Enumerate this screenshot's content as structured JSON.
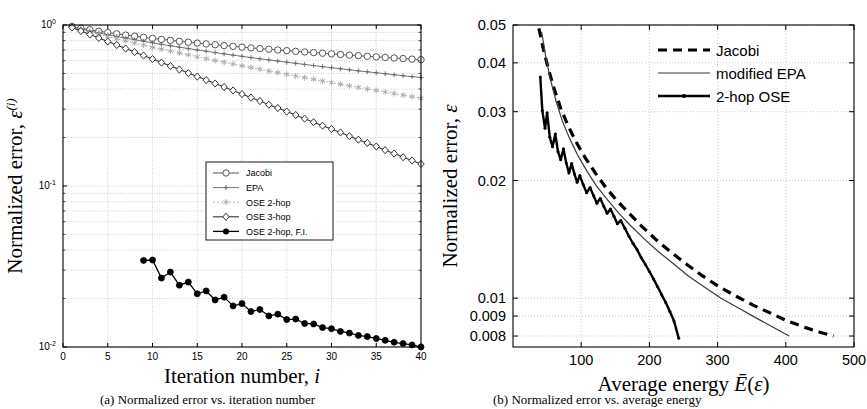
{
  "figure": {
    "panel_a_caption": "(a) Normalized error vs. iteration number",
    "panel_b_caption": "(b) Normalized error vs. average energy"
  },
  "chart_data": [
    {
      "id": "panel-a",
      "type": "line",
      "title": "",
      "xlabel": "Iteration number, i",
      "ylabel": "Normalized error, ε(i)",
      "ylabel_main": "Normalized error, ",
      "ylabel_sym": "ε",
      "ylabel_sup": "(i)",
      "yscale": "log",
      "xlim": [
        0,
        40
      ],
      "ylim": [
        0.01,
        1
      ],
      "grid": true,
      "xticks": [
        0,
        5,
        10,
        15,
        20,
        25,
        30,
        35,
        40
      ],
      "xticklabels": [
        "0",
        "5",
        "10",
        "15",
        "20",
        "25",
        "30",
        "35",
        "40"
      ],
      "yticks": [
        1,
        0.1,
        0.01
      ],
      "yticklabels": [
        "10^0",
        "10^-1",
        "10^-2"
      ],
      "legend_position": "center",
      "series": [
        {
          "name": "Jacobi",
          "marker": "circle-open",
          "color": "#555555",
          "linewidth": 1,
          "dash": "none",
          "x": [
            1,
            2,
            3,
            4,
            5,
            6,
            7,
            8,
            9,
            10,
            11,
            12,
            13,
            14,
            15,
            16,
            17,
            18,
            19,
            20,
            21,
            22,
            23,
            24,
            25,
            26,
            27,
            28,
            29,
            30,
            31,
            32,
            33,
            34,
            35,
            36,
            37,
            38,
            39,
            40
          ],
          "y": [
            0.98,
            0.955,
            0.935,
            0.915,
            0.897,
            0.881,
            0.866,
            0.852,
            0.838,
            0.826,
            0.814,
            0.803,
            0.792,
            0.782,
            0.772,
            0.763,
            0.754,
            0.745,
            0.737,
            0.729,
            0.721,
            0.714,
            0.707,
            0.7,
            0.693,
            0.686,
            0.68,
            0.674,
            0.668,
            0.662,
            0.656,
            0.65,
            0.645,
            0.639,
            0.634,
            0.629,
            0.624,
            0.619,
            0.614,
            0.609
          ]
        },
        {
          "name": "EPA",
          "marker": "plus",
          "color": "#666666",
          "linewidth": 0.9,
          "dash": "none",
          "x": [
            1,
            2,
            3,
            4,
            5,
            6,
            7,
            8,
            9,
            10,
            11,
            12,
            13,
            14,
            15,
            16,
            17,
            18,
            19,
            20,
            21,
            22,
            23,
            24,
            25,
            26,
            27,
            28,
            29,
            30,
            31,
            32,
            33,
            34,
            35,
            36,
            37,
            38,
            39,
            40
          ],
          "y": [
            0.975,
            0.945,
            0.918,
            0.893,
            0.87,
            0.849,
            0.829,
            0.81,
            0.792,
            0.775,
            0.759,
            0.743,
            0.728,
            0.714,
            0.7,
            0.687,
            0.674,
            0.662,
            0.65,
            0.639,
            0.628,
            0.617,
            0.607,
            0.597,
            0.587,
            0.578,
            0.569,
            0.56,
            0.551,
            0.543,
            0.535,
            0.527,
            0.519,
            0.512,
            0.505,
            0.498,
            0.491,
            0.484,
            0.478,
            0.472
          ]
        },
        {
          "name": "OSE 2-hop",
          "marker": "star",
          "color": "#aaaaaa",
          "linewidth": 0.9,
          "dash": "2,2",
          "x": [
            1,
            2,
            3,
            4,
            5,
            6,
            7,
            8,
            9,
            10,
            11,
            12,
            13,
            14,
            15,
            16,
            17,
            18,
            19,
            20,
            21,
            22,
            23,
            24,
            25,
            26,
            27,
            28,
            29,
            30,
            31,
            32,
            33,
            34,
            35,
            36,
            37,
            38,
            39,
            40
          ],
          "y": [
            0.972,
            0.938,
            0.906,
            0.876,
            0.848,
            0.822,
            0.797,
            0.773,
            0.751,
            0.729,
            0.709,
            0.689,
            0.67,
            0.652,
            0.635,
            0.618,
            0.602,
            0.587,
            0.572,
            0.558,
            0.544,
            0.531,
            0.518,
            0.506,
            0.494,
            0.482,
            0.471,
            0.46,
            0.449,
            0.439,
            0.429,
            0.419,
            0.41,
            0.401,
            0.392,
            0.383,
            0.375,
            0.367,
            0.359,
            0.351
          ]
        },
        {
          "name": "OSE 3-hop",
          "marker": "diamond-open",
          "color": "#333333",
          "linewidth": 1.1,
          "dash": "none",
          "x": [
            1,
            2,
            3,
            4,
            5,
            6,
            7,
            8,
            9,
            10,
            11,
            12,
            13,
            14,
            15,
            16,
            17,
            18,
            19,
            20,
            21,
            22,
            23,
            24,
            25,
            26,
            27,
            28,
            29,
            30,
            31,
            32,
            33,
            34,
            35,
            36,
            37,
            38,
            39,
            40
          ],
          "y": [
            0.965,
            0.918,
            0.873,
            0.83,
            0.79,
            0.751,
            0.714,
            0.679,
            0.646,
            0.614,
            0.584,
            0.556,
            0.529,
            0.503,
            0.478,
            0.455,
            0.433,
            0.412,
            0.392,
            0.372,
            0.354,
            0.337,
            0.32,
            0.305,
            0.29,
            0.276,
            0.262,
            0.249,
            0.237,
            0.226,
            0.215,
            0.204,
            0.194,
            0.185,
            0.176,
            0.167,
            0.159,
            0.151,
            0.144,
            0.137
          ]
        },
        {
          "name": "OSE 2-hop, F.I.",
          "marker": "circle-filled",
          "color": "#000000",
          "linewidth": 1.3,
          "dash": "none",
          "x": [
            9,
            10,
            11,
            12,
            13,
            14,
            15,
            16,
            17,
            18,
            19,
            20,
            21,
            22,
            23,
            24,
            25,
            26,
            27,
            28,
            29,
            30,
            31,
            32,
            33,
            34,
            35,
            36,
            37,
            38,
            39,
            40
          ],
          "y": [
            0.0345,
            0.0347,
            0.0268,
            0.0292,
            0.0242,
            0.0253,
            0.0214,
            0.0223,
            0.0196,
            0.0204,
            0.018,
            0.0186,
            0.0166,
            0.0171,
            0.0156,
            0.016,
            0.0148,
            0.0149,
            0.014,
            0.0139,
            0.0132,
            0.013,
            0.0125,
            0.0122,
            0.0118,
            0.0116,
            0.0113,
            0.011,
            0.0107,
            0.0105,
            0.0103,
            0.01
          ]
        }
      ]
    },
    {
      "id": "panel-b",
      "type": "line",
      "title": "",
      "xlabel": "Average energy Ē(ε)",
      "xlabel_main": "Average energy ",
      "xlabel_sym": "Ē(ε)",
      "ylabel": "Normalized error, ε",
      "ylabel_main": "Normalized error, ",
      "ylabel_sym": "ε",
      "yscale": "log",
      "xscale": "linear",
      "xlim": [
        0,
        500
      ],
      "ylim": [
        0.0075,
        0.05
      ],
      "grid": true,
      "xticks": [
        100,
        200,
        300,
        400,
        500
      ],
      "xticklabels": [
        "100",
        "200",
        "300",
        "400",
        "500"
      ],
      "yticks": [
        0.05,
        0.04,
        0.03,
        0.02,
        0.01,
        0.009,
        0.008
      ],
      "yticklabels": [
        "0.05",
        "0.04",
        "0.03",
        "0.02",
        "0.01",
        "0.009",
        "0.008"
      ],
      "legend_position": "top-right",
      "series": [
        {
          "name": "Jacobi",
          "marker": "none",
          "color": "#000000",
          "linewidth": 3.2,
          "dash": "9,6",
          "x": [
            38,
            45,
            52,
            60,
            70,
            80,
            92,
            105,
            120,
            136,
            152,
            170,
            190,
            210,
            232,
            255,
            278,
            302,
            328,
            352,
            378,
            402,
            428,
            450,
            470
          ],
          "y": [
            0.049,
            0.043,
            0.0385,
            0.0345,
            0.0306,
            0.0278,
            0.0252,
            0.023,
            0.021,
            0.0192,
            0.0178,
            0.0165,
            0.0152,
            0.0141,
            0.0131,
            0.0122,
            0.0114,
            0.0107,
            0.0101,
            0.0096,
            0.00915,
            0.00875,
            0.00842,
            0.00818,
            0.008
          ]
        },
        {
          "name": "modified EPA",
          "marker": "none",
          "color": "#3a3a3a",
          "linewidth": 1.2,
          "dash": "none",
          "x": [
            42,
            48,
            55,
            63,
            72,
            83,
            95,
            108,
            122,
            138,
            155,
            173,
            192,
            212,
            234,
            257,
            280,
            305,
            330,
            355,
            380,
            405
          ],
          "y": [
            0.048,
            0.0415,
            0.0362,
            0.032,
            0.0285,
            0.0256,
            0.0232,
            0.0212,
            0.0194,
            0.0179,
            0.0165,
            0.0153,
            0.0142,
            0.0132,
            0.0123,
            0.0114,
            0.0107,
            0.01,
            0.00945,
            0.00893,
            0.00845,
            0.008
          ]
        },
        {
          "name": "2-hop OSE",
          "marker": "dot",
          "color": "#000000",
          "linewidth": 2.4,
          "dash": "none",
          "x": [
            40,
            43,
            47,
            50,
            54,
            58,
            62,
            66,
            70,
            74,
            78,
            82,
            86,
            90,
            94,
            98,
            103,
            108,
            113,
            118,
            123,
            128,
            133,
            138,
            143,
            148,
            153,
            158,
            164,
            170,
            176,
            182,
            188,
            194,
            200,
            206,
            212,
            218,
            224,
            230,
            236,
            243
          ],
          "y": [
            0.0368,
            0.0302,
            0.0272,
            0.0298,
            0.0258,
            0.0244,
            0.0263,
            0.0237,
            0.0226,
            0.0241,
            0.0222,
            0.0209,
            0.0221,
            0.0208,
            0.0198,
            0.0206,
            0.0195,
            0.0186,
            0.0192,
            0.0183,
            0.0175,
            0.018,
            0.0172,
            0.0165,
            0.0169,
            0.0162,
            0.0155,
            0.0158,
            0.0151,
            0.0144,
            0.0138,
            0.0133,
            0.0127,
            0.0122,
            0.0117,
            0.0112,
            0.0107,
            0.0102,
            0.00975,
            0.00925,
            0.00875,
            0.0079
          ]
        }
      ]
    }
  ]
}
